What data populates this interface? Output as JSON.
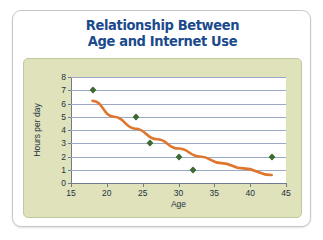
{
  "card": {
    "name": "chart-card"
  },
  "chart_data": {
    "type": "scatter",
    "title": "Relationship Between Age and Internet Use",
    "title_line1": "Relationship Between",
    "title_line2": "Age and Internet Use",
    "xlabel": "Age",
    "ylabel": "Hours per day",
    "xlim": [
      15,
      45
    ],
    "ylim": [
      0,
      8
    ],
    "xticks": [
      15,
      20,
      25,
      30,
      35,
      40,
      45
    ],
    "yticks": [
      0,
      1,
      2,
      3,
      4,
      5,
      6,
      7,
      8
    ],
    "xtick_labels": [
      "15",
      "20",
      "25",
      "30",
      "35",
      "40",
      "45"
    ],
    "ytick_labels": [
      "0",
      "1",
      "2",
      "3",
      "4",
      "5",
      "6",
      "7",
      "8"
    ],
    "grid": "horizontal",
    "legend": "none",
    "point_color": "#3d6b32",
    "trend_color": "#e0762e",
    "plot_background": "#ffffff",
    "panel_background": "#dfe2bb",
    "gridline_color": "#9aa9c6",
    "title_color": "#1b4a8c",
    "series": [
      {
        "name": "Internet use",
        "marker": "diamond",
        "points": [
          {
            "x": 18,
            "y": 7
          },
          {
            "x": 24,
            "y": 5
          },
          {
            "x": 26,
            "y": 3
          },
          {
            "x": 30,
            "y": 2
          },
          {
            "x": 32,
            "y": 1
          },
          {
            "x": 43,
            "y": 2
          }
        ]
      }
    ],
    "trendline": {
      "name": "decreasing trend curve",
      "type": "curve",
      "points": [
        {
          "x": 18,
          "y": 6.2
        },
        {
          "x": 21,
          "y": 5.0
        },
        {
          "x": 24,
          "y": 4.1
        },
        {
          "x": 27,
          "y": 3.3
        },
        {
          "x": 30,
          "y": 2.6
        },
        {
          "x": 33,
          "y": 2.0
        },
        {
          "x": 36,
          "y": 1.5
        },
        {
          "x": 39,
          "y": 1.1
        },
        {
          "x": 43,
          "y": 0.6
        }
      ]
    }
  }
}
